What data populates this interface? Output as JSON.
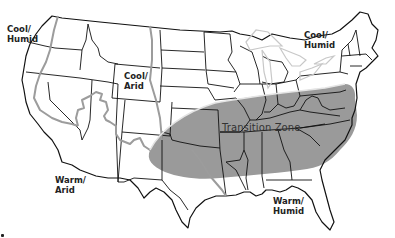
{
  "map": {
    "title": "US Climate Zones for Turfgrass",
    "colors": {
      "transition_zone_fill": "#9a9a9a",
      "state_border": "#111111",
      "zone_divider": "#9c9c9c",
      "great_lakes_outline": "#c8c8c8",
      "background": "#ffffff"
    },
    "regions": [
      {
        "id": "cool-humid-west",
        "line1": "Cool/",
        "line2": "Humid"
      },
      {
        "id": "cool-arid",
        "line1": "Cool/",
        "line2": "Arid"
      },
      {
        "id": "cool-humid-east",
        "line1": "Cool/",
        "line2": "Humid"
      },
      {
        "id": "warm-arid",
        "line1": "Warm/",
        "line2": "Arid"
      },
      {
        "id": "warm-humid",
        "line1": "Warm/",
        "line2": "Humid"
      }
    ],
    "transition_zone_label": "Transition Zone"
  }
}
